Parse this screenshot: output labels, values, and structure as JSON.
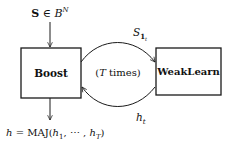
{
  "diagram": {
    "input_label": {
      "bold_symbol": "S",
      "relation": " ∈ ",
      "set": "B",
      "set_superscript": "N"
    },
    "nodes": [
      {
        "id": "boost",
        "label": "Boost"
      },
      {
        "id": "weaklearn",
        "label": "WeakLearn"
      }
    ],
    "edges": [
      {
        "from": "input",
        "to": "boost",
        "label": "S ∈ B^N"
      },
      {
        "from": "boost",
        "to": "weaklearn",
        "label_base": "S",
        "label_sub": "1",
        "label_subsub": "t"
      },
      {
        "from": "weaklearn",
        "to": "boost",
        "label_base": "h",
        "label_sub": "t"
      },
      {
        "from": "boost",
        "to": "output",
        "label": "h = MAJ(h1, ..., hT)"
      }
    ],
    "loop_label": {
      "open": "(",
      "var": "T",
      "text": " times)"
    },
    "output_label": {
      "lhs": "h",
      "eq": " = ",
      "fn": "MAJ",
      "open": "(",
      "h1_base": "h",
      "h1_sub": "1",
      "dots": ", ⋯ , ",
      "hT_base": "h",
      "hT_sub": "T",
      "close": ")"
    },
    "colors": {
      "stroke": "#1a1a1a",
      "text": "#111111"
    }
  }
}
